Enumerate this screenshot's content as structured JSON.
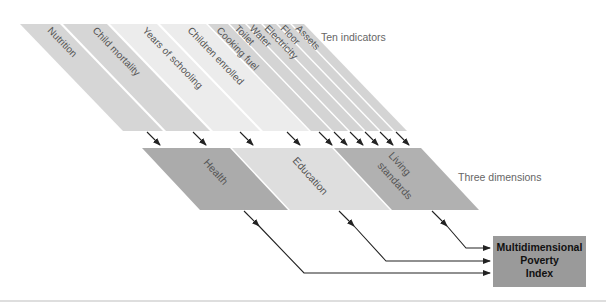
{
  "captions": {
    "indicators": "Ten indicators",
    "dimensions": "Three dimensions"
  },
  "indicators": [
    {
      "label": "Nutrition",
      "dimension": "Health",
      "color": "#d6d6d6"
    },
    {
      "label": "Child mortality",
      "dimension": "Health",
      "color": "#d6d6d6"
    },
    {
      "label": "Years of schooling",
      "dimension": "Education",
      "color": "#ececec"
    },
    {
      "label": "Children enrolled",
      "dimension": "Education",
      "color": "#ececec"
    },
    {
      "label": "Cooking fuel",
      "dimension": "Living standards",
      "color": "#d4d4d4"
    },
    {
      "label": "Toilet",
      "dimension": "Living standards",
      "color": "#d4d4d4"
    },
    {
      "label": "Water",
      "dimension": "Living standards",
      "color": "#d4d4d4"
    },
    {
      "label": "Electricity",
      "dimension": "Living standards",
      "color": "#d4d4d4"
    },
    {
      "label": "Floor",
      "dimension": "Living standards",
      "color": "#d4d4d4"
    },
    {
      "label": "Assets",
      "dimension": "Living standards",
      "color": "#d4d4d4"
    }
  ],
  "dimensions": [
    {
      "label": "Health",
      "color": "#ababab"
    },
    {
      "label": "Education",
      "color": "#dedede"
    },
    {
      "label_line1": "Living",
      "label_line2": "standards",
      "color": "#b1b1b1"
    }
  ],
  "output": {
    "line1": "Multidimensional",
    "line2": "Poverty",
    "line3": "Index",
    "color": "#9a9a9a"
  }
}
